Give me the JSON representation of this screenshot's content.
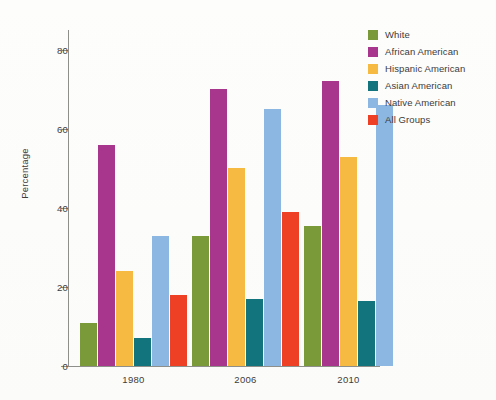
{
  "chart_data": {
    "type": "bar",
    "title": "",
    "subtitle": "",
    "xlabel": "",
    "ylabel": "Percentage",
    "categories": [
      "1980",
      "2006",
      "2010"
    ],
    "ylim": [
      0,
      85
    ],
    "yticks": [
      0,
      20,
      40,
      60,
      80
    ],
    "ytick_labels": [
      "0",
      "20",
      "40",
      "60",
      "80"
    ],
    "grid": false,
    "legend_position": "top-right",
    "series": [
      {
        "name": "White",
        "color": "#7a9a3a",
        "values": [
          11,
          33,
          35.5
        ]
      },
      {
        "name": "African American",
        "color": "#a8368c",
        "values": [
          56,
          70,
          72
        ]
      },
      {
        "name": "Hispanic American",
        "color": "#f6b942",
        "values": [
          24,
          50,
          53
        ]
      },
      {
        "name": "Asian American",
        "color": "#12757d",
        "values": [
          7,
          17,
          16.5
        ]
      },
      {
        "name": "Native American",
        "color": "#8bb7e2",
        "values": [
          33,
          65,
          66
        ]
      },
      {
        "name": "All Groups",
        "color": "#ee4024",
        "values": [
          18,
          39,
          null
        ]
      }
    ]
  },
  "axis": {
    "y_title": "Percentage"
  },
  "legend": {
    "items": [
      {
        "label": "White",
        "color": "#7a9a3a"
      },
      {
        "label": "African American",
        "color": "#a8368c"
      },
      {
        "label": "Hispanic American",
        "color": "#f6b942"
      },
      {
        "label": "Asian American",
        "color": "#12757d"
      },
      {
        "label": "Native American",
        "color": "#8bb7e2"
      },
      {
        "label": "All Groups",
        "color": "#ee4024"
      }
    ]
  }
}
